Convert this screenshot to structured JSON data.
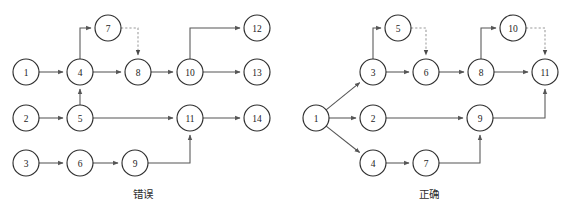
{
  "figure": {
    "background_color": "#ffffff",
    "node_stroke_color": "#2f2f2f",
    "edge_color": "#555555",
    "dashed_edge_color": "#9a9a9a",
    "node_radius": 13
  },
  "captions": {
    "left": "错误",
    "right": "正确"
  },
  "diagrams": [
    {
      "id": "left-diagram",
      "caption": "错误",
      "nodes": [
        {
          "id": "L1",
          "label": "1",
          "cx": 26,
          "cy": 72
        },
        {
          "id": "L2",
          "label": "2",
          "cx": 26,
          "cy": 118
        },
        {
          "id": "L3",
          "label": "3",
          "cx": 26,
          "cy": 163
        },
        {
          "id": "L4",
          "label": "4",
          "cx": 80,
          "cy": 72
        },
        {
          "id": "L5",
          "label": "5",
          "cx": 80,
          "cy": 118
        },
        {
          "id": "L6",
          "label": "6",
          "cx": 80,
          "cy": 163
        },
        {
          "id": "L7",
          "label": "7",
          "cx": 108,
          "cy": 28
        },
        {
          "id": "L8",
          "label": "8",
          "cx": 138,
          "cy": 72
        },
        {
          "id": "L9",
          "label": "9",
          "cx": 135,
          "cy": 163
        },
        {
          "id": "L10",
          "label": "10",
          "cx": 190,
          "cy": 72
        },
        {
          "id": "L11",
          "label": "11",
          "cx": 190,
          "cy": 118
        },
        {
          "id": "L12",
          "label": "12",
          "cx": 257,
          "cy": 28
        },
        {
          "id": "L13",
          "label": "13",
          "cx": 257,
          "cy": 72
        },
        {
          "id": "L14",
          "label": "14",
          "cx": 257,
          "cy": 118
        }
      ],
      "edges": [
        {
          "from": "L1",
          "to": "L4",
          "style": "solid",
          "route": "straight"
        },
        {
          "from": "L2",
          "to": "L5",
          "style": "solid",
          "route": "straight"
        },
        {
          "from": "L3",
          "to": "L6",
          "style": "solid",
          "route": "straight"
        },
        {
          "from": "L4",
          "to": "L7",
          "style": "solid",
          "route": "up-then-right"
        },
        {
          "from": "L4",
          "to": "L8",
          "style": "solid",
          "route": "straight"
        },
        {
          "from": "L5",
          "to": "L4",
          "style": "solid",
          "route": "straight"
        },
        {
          "from": "L5",
          "to": "L11",
          "style": "solid",
          "route": "straight"
        },
        {
          "from": "L6",
          "to": "L9",
          "style": "solid",
          "route": "straight"
        },
        {
          "from": "L7",
          "to": "L8",
          "style": "dashed",
          "route": "right-then-down"
        },
        {
          "from": "L8",
          "to": "L10",
          "style": "solid",
          "route": "straight"
        },
        {
          "from": "L9",
          "to": "L11",
          "style": "solid",
          "route": "right-then-up"
        },
        {
          "from": "L10",
          "to": "L12",
          "style": "solid",
          "route": "up-then-right"
        },
        {
          "from": "L10",
          "to": "L13",
          "style": "solid",
          "route": "straight"
        },
        {
          "from": "L11",
          "to": "L14",
          "style": "solid",
          "route": "straight"
        }
      ]
    },
    {
      "id": "right-diagram",
      "caption": "正确",
      "nodes": [
        {
          "id": "R1",
          "label": "1",
          "cx": 316,
          "cy": 118
        },
        {
          "id": "R2",
          "label": "2",
          "cx": 373,
          "cy": 118
        },
        {
          "id": "R3",
          "label": "3",
          "cx": 373,
          "cy": 72
        },
        {
          "id": "R4",
          "label": "4",
          "cx": 373,
          "cy": 163
        },
        {
          "id": "R5",
          "label": "5",
          "cx": 398,
          "cy": 28
        },
        {
          "id": "R6",
          "label": "6",
          "cx": 426,
          "cy": 72
        },
        {
          "id": "R7",
          "label": "7",
          "cx": 426,
          "cy": 163
        },
        {
          "id": "R8",
          "label": "8",
          "cx": 481,
          "cy": 72
        },
        {
          "id": "R9",
          "label": "9",
          "cx": 480,
          "cy": 118
        },
        {
          "id": "R10",
          "label": "10",
          "cx": 513,
          "cy": 28
        },
        {
          "id": "R11",
          "label": "11",
          "cx": 545,
          "cy": 72
        }
      ],
      "edges": [
        {
          "from": "R1",
          "to": "R3",
          "style": "solid",
          "route": "diagonal"
        },
        {
          "from": "R1",
          "to": "R2",
          "style": "solid",
          "route": "straight"
        },
        {
          "from": "R1",
          "to": "R4",
          "style": "solid",
          "route": "diagonal"
        },
        {
          "from": "R3",
          "to": "R5",
          "style": "solid",
          "route": "up-then-right"
        },
        {
          "from": "R3",
          "to": "R6",
          "style": "solid",
          "route": "straight"
        },
        {
          "from": "R5",
          "to": "R6",
          "style": "dashed",
          "route": "right-then-down"
        },
        {
          "from": "R2",
          "to": "R9",
          "style": "solid",
          "route": "straight"
        },
        {
          "from": "R4",
          "to": "R7",
          "style": "solid",
          "route": "straight"
        },
        {
          "from": "R7",
          "to": "R9",
          "style": "solid",
          "route": "right-then-up"
        },
        {
          "from": "R6",
          "to": "R8",
          "style": "solid",
          "route": "straight"
        },
        {
          "from": "R8",
          "to": "R10",
          "style": "solid",
          "route": "up-then-right"
        },
        {
          "from": "R8",
          "to": "R11",
          "style": "solid",
          "route": "straight"
        },
        {
          "from": "R10",
          "to": "R11",
          "style": "dashed",
          "route": "right-then-down"
        },
        {
          "from": "R9",
          "to": "R11",
          "style": "solid",
          "route": "right-then-up"
        }
      ]
    }
  ]
}
